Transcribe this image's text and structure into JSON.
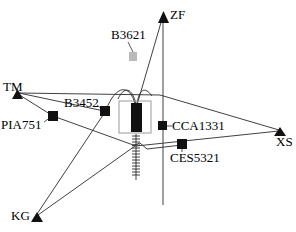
{
  "diagram": {
    "colors": {
      "line": "#2b2b2b",
      "node_dark": "#111111",
      "node_light": "#b9b9b9",
      "box_border": "#9a9a9a",
      "background": "#ffffff",
      "text": "#000000"
    },
    "nodes": [
      {
        "id": "TM",
        "label": "TM",
        "marker": "triangle-up",
        "marker_style": "dark",
        "x": 17,
        "y": 94
      },
      {
        "id": "PIA751",
        "label": "PIA751",
        "marker": "square",
        "marker_style": "dark",
        "x": 53,
        "y": 116
      },
      {
        "id": "B3452",
        "label": "B3452",
        "marker": "square",
        "marker_style": "dark",
        "x": 105,
        "y": 111
      },
      {
        "id": "B3621",
        "label": "B3621",
        "marker": "square",
        "marker_style": "light",
        "x": 133,
        "y": 56
      },
      {
        "id": "ZF",
        "label": "ZF",
        "marker": "triangle-up",
        "marker_style": "dark",
        "x": 164,
        "y": 14
      },
      {
        "id": "CCA1331",
        "label": "CCA1331",
        "marker": "square",
        "marker_style": "dark",
        "x": 162,
        "y": 126
      },
      {
        "id": "CES5321",
        "label": "CES5321",
        "marker": "square",
        "marker_style": "dark",
        "x": 182,
        "y": 144
      },
      {
        "id": "XS",
        "label": "XS",
        "marker": "triangle-up",
        "marker_style": "dark",
        "x": 280,
        "y": 131
      },
      {
        "id": "KG",
        "label": "KG",
        "marker": "triangle-up",
        "marker_style": "dark",
        "x": 36,
        "y": 217
      },
      {
        "id": "CENTER",
        "label": "",
        "marker": "thick-bar",
        "marker_style": "dark",
        "x": 136,
        "y": 118
      }
    ],
    "edges": [
      {
        "from": "TM",
        "to": "B3452",
        "kind": "straight"
      },
      {
        "from": "TM",
        "to": "XS",
        "kind": "straight"
      },
      {
        "from": "TM",
        "to": "PIA751",
        "kind": "straight"
      },
      {
        "from": "PIA751",
        "to": "XS",
        "kind": "straight"
      },
      {
        "from": "B3452",
        "to": "CENTER",
        "kind": "curved"
      },
      {
        "from": "B3452",
        "to": "KG",
        "kind": "straight"
      },
      {
        "from": "ZF",
        "to": "CENTER",
        "kind": "straight"
      },
      {
        "from": "ZF",
        "to": "CCA1331",
        "kind": "axis"
      },
      {
        "from": "CENTER",
        "to": "KG",
        "kind": "straight"
      },
      {
        "from": "CENTER",
        "to": "CES5321",
        "kind": "straight"
      },
      {
        "from": "CES5321",
        "to": "XS",
        "kind": "straight"
      },
      {
        "from": "CENTER",
        "to": "GROUND",
        "kind": "hatched"
      }
    ],
    "annotations": {
      "center_box": "highlight-rectangle",
      "hatched_line": "ground-hatch",
      "b3621_leader": "leader-line"
    }
  }
}
